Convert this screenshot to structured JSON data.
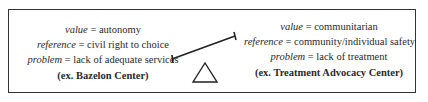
{
  "left": {
    "rows": [
      {
        "term": "value",
        "eq": " = ",
        "desc": "autonomy"
      },
      {
        "term": "reference",
        "eq": " = ",
        "desc": "civil right to choice"
      },
      {
        "term": "problem",
        "eq": " = ",
        "desc": "lack of adequate services"
      }
    ],
    "example": "(ex. Bazelon Center)"
  },
  "right": {
    "rows": [
      {
        "term": "value",
        "eq": " = ",
        "desc": "communitarian"
      },
      {
        "term": "reference",
        "eq": " = ",
        "desc": "community/individual safety"
      },
      {
        "term": "problem",
        "eq": " = ",
        "desc": "lack of treatment"
      }
    ],
    "example": "(ex. Treatment Advocacy Center)"
  },
  "icons": {
    "seesaw": "seesaw-balance-icon"
  }
}
